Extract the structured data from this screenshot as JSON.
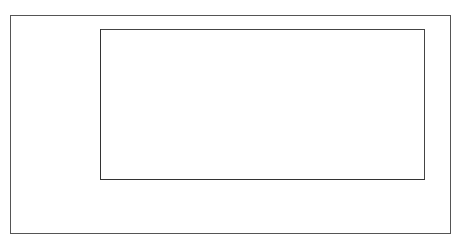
{
  "chart_data": {
    "type": "bar",
    "orientation": "horizontal",
    "title": "",
    "categories": [
      "Kenya",
      "South Africa",
      "Thailand",
      "China",
      "Brazil",
      "Australia",
      "North America"
    ],
    "values": [
      60,
      746,
      1287,
      2486,
      3255,
      4729,
      6150
    ],
    "data_labels": [
      "60",
      "746",
      "1287",
      "2486",
      "3255",
      "4729",
      "6150"
    ],
    "xlabel": "Cubic metres per capita",
    "ylabel": "",
    "xlim": [
      0,
      7000
    ],
    "xticks": [
      "0",
      "1000",
      "2000",
      "3000",
      "4000",
      "5000",
      "6000",
      "7000"
    ],
    "grid": true,
    "legend": null,
    "colors": {
      "bar_fill": "#9d9d9d",
      "bar_border": "#444444",
      "grid": "#555555"
    }
  }
}
